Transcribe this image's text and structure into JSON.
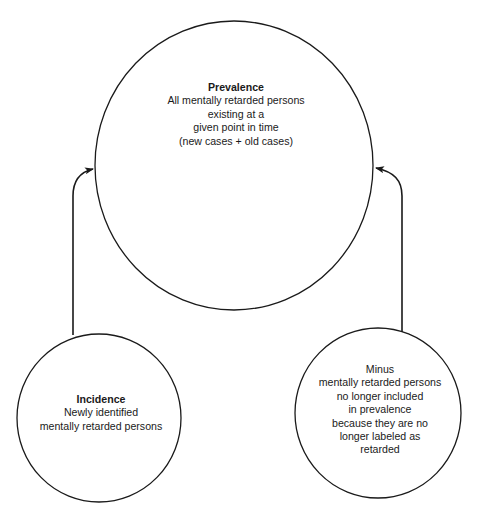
{
  "diagram": {
    "type": "flow",
    "colors": {
      "stroke": "#1a1a1a",
      "background": "#ffffff",
      "text": "#1a1a1a"
    },
    "nodes": {
      "prevalence": {
        "title": "Prevalence",
        "lines": [
          "All mentally retarded persons",
          "existing at a",
          "given point in time",
          "(new cases + old cases)"
        ]
      },
      "incidence": {
        "title": "Incidence",
        "lines": [
          "Newly identified",
          "mentally retarded persons"
        ]
      },
      "minus": {
        "lines": [
          "Minus",
          "mentally retarded persons",
          "no longer included",
          "in prevalence",
          "because they are no",
          "longer labeled as",
          "retarded"
        ]
      }
    },
    "edges": [
      {
        "from": "incidence",
        "to": "prevalence"
      },
      {
        "from": "minus",
        "to": "prevalence"
      }
    ]
  }
}
